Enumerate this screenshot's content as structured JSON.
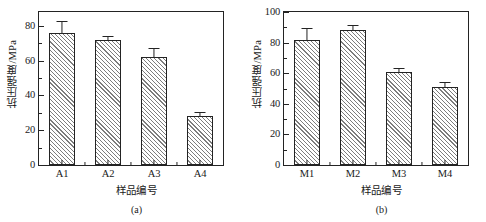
{
  "figure": {
    "background_color": "#ffffff",
    "line_color": "#232323",
    "hatch_color": "#7d7d7d"
  },
  "chart_data": [
    {
      "type": "bar",
      "panel_id": "a",
      "caption": "(a)",
      "title": "",
      "xlabel": "样品编号",
      "ylabel": "抗压强度/MPa",
      "categories": [
        "A1",
        "A2",
        "A3",
        "A4"
      ],
      "values": [
        76,
        72,
        62,
        28
      ],
      "errors": [
        6,
        1.5,
        5,
        2
      ],
      "ylim": [
        0,
        88
      ],
      "yticks": [
        0,
        20,
        40,
        60,
        80
      ],
      "ytick_labels": [
        "0",
        "20",
        "40",
        "60",
        "80"
      ],
      "yminor_step": 10,
      "grid": false,
      "legend": "none",
      "bar_style": {
        "fill": "#ffffff",
        "hatch": "diagonal-45",
        "edge": "#232323"
      }
    },
    {
      "type": "bar",
      "panel_id": "b",
      "caption": "(b)",
      "title": "",
      "xlabel": "样品编号",
      "ylabel": "抗压强度/MPa",
      "categories": [
        "M1",
        "M2",
        "M3",
        "M4"
      ],
      "values": [
        82,
        88,
        61,
        51
      ],
      "errors": [
        7,
        3,
        1.5,
        2.5
      ],
      "ylim": [
        0,
        100
      ],
      "yticks": [
        0,
        20,
        40,
        60,
        80,
        100
      ],
      "ytick_labels": [
        "0",
        "20",
        "40",
        "60",
        "80",
        "100"
      ],
      "yminor_step": 10,
      "grid": false,
      "legend": "none",
      "bar_style": {
        "fill": "#ffffff",
        "hatch": "diagonal-45",
        "edge": "#232323"
      }
    }
  ]
}
